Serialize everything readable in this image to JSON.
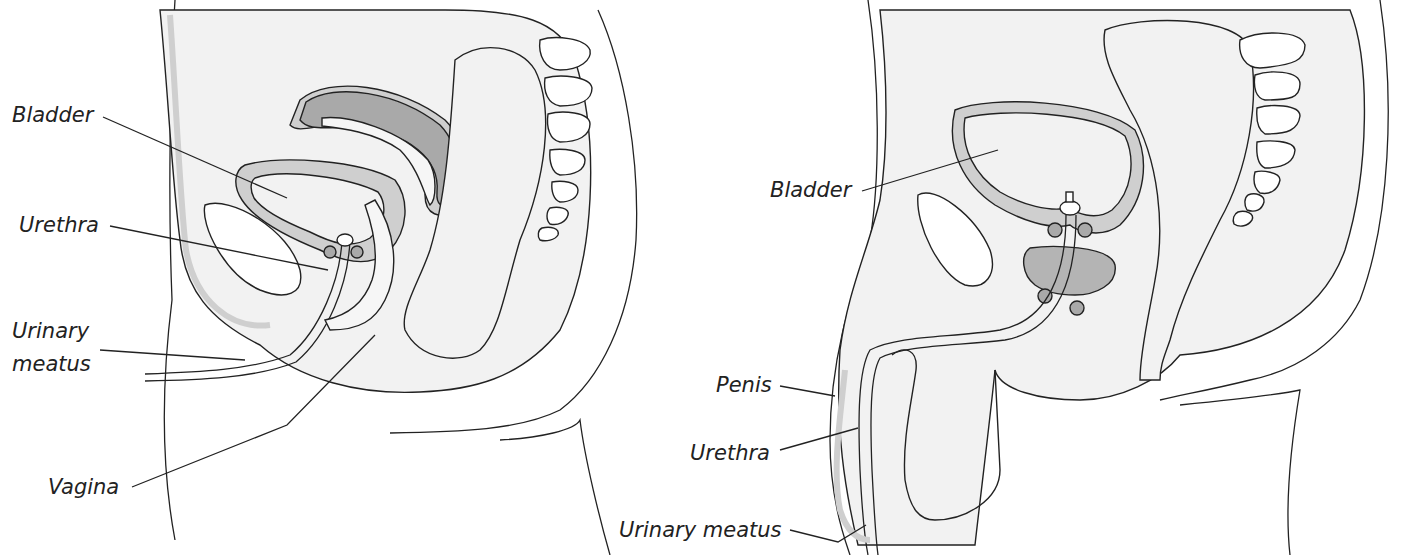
{
  "diagram": {
    "type": "anatomical-cross-section",
    "colors": {
      "background": "#ffffff",
      "body_fill": "#f2f2f2",
      "wall_fill": "#cfcfcf",
      "organ_dark": "#a9a9a9",
      "gland_fill": "#b4b4b4",
      "outline": "#222222"
    },
    "female": {
      "labels": {
        "bladder": "Bladder",
        "urethra": "Urethra",
        "urinary_meatus_line1": "Urinary",
        "urinary_meatus_line2": "meatus",
        "vagina": "Vagina"
      }
    },
    "male": {
      "labels": {
        "bladder": "Bladder",
        "penis": "Penis",
        "urethra": "Urethra",
        "urinary_meatus": "Urinary meatus"
      }
    }
  }
}
